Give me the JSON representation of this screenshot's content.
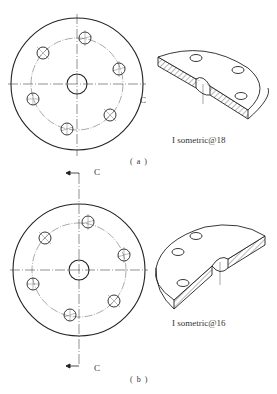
{
  "figures": [
    {
      "id": "a",
      "caption": "( a )",
      "iso_label": "I sometric@18",
      "section_label": "C",
      "plan": {
        "cx": 77,
        "cy": 84,
        "outer_r": 66,
        "bolt_r": 46,
        "center_hole_r": 10,
        "hole_r": 6,
        "holes": [
          [
            85,
            38
          ],
          [
            43,
            53
          ],
          [
            119,
            69
          ],
          [
            33,
            99
          ],
          [
            110,
            115
          ],
          [
            67,
            129
          ]
        ]
      }
    },
    {
      "id": "b",
      "caption": "( b )",
      "iso_label": "I sometric@16",
      "section_label_top": "C",
      "section_label_bottom": "C",
      "plan": {
        "cx": 79,
        "cy": 270,
        "outer_r": 66,
        "bolt_r": 47,
        "center_hole_r": 10,
        "hole_r": 6,
        "holes": [
          [
            88,
            222
          ],
          [
            45,
            238
          ],
          [
            124,
            255
          ],
          [
            33,
            284
          ],
          [
            114,
            301
          ],
          [
            70,
            315
          ]
        ]
      }
    }
  ],
  "colors": {
    "line": "#222222",
    "thin": "#555555",
    "background": "#ffffff"
  }
}
